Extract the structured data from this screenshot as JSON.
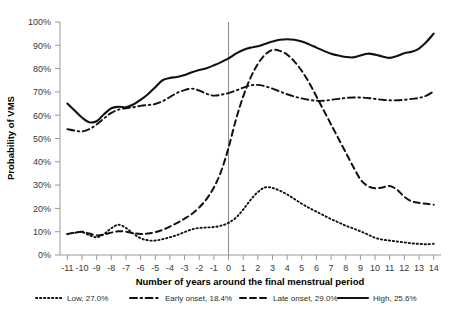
{
  "chart_data": {
    "type": "line",
    "title": "",
    "xlabel": "Number of years around the final menstrual period",
    "ylabel": "Probability of VMS",
    "xlim": [
      -11.5,
      14.5
    ],
    "ylim": [
      0,
      100
    ],
    "grid": false,
    "legend_position": "bottom",
    "y_tick_labels": [
      "0%",
      "10%",
      "20%",
      "30%",
      "40%",
      "50%",
      "60%",
      "70%",
      "80%",
      "90%",
      "100%"
    ],
    "y_tick_values": [
      0,
      10,
      20,
      30,
      40,
      50,
      60,
      70,
      80,
      90,
      100
    ],
    "x_tick_labels": [
      "-11",
      "-10",
      "-9",
      "-8",
      "-7",
      "-6",
      "-5",
      "-4",
      "-3",
      "-2",
      "-1",
      "0",
      "1",
      "2",
      "3",
      "4",
      "5",
      "6",
      "7",
      "8",
      "9",
      "10",
      "11",
      "12",
      "13",
      "14"
    ],
    "x": [
      -11,
      -10.5,
      -10,
      -9.5,
      -9,
      -8.5,
      -8,
      -7.5,
      -7,
      -6.5,
      -6,
      -5.5,
      -5,
      -4.5,
      -4,
      -3.5,
      -3,
      -2.5,
      -2,
      -1.5,
      -1,
      -0.5,
      0,
      0.5,
      1,
      1.5,
      2,
      2.5,
      3,
      3.5,
      4,
      4.5,
      5,
      5.5,
      6,
      6.5,
      7,
      7.5,
      8,
      8.5,
      9,
      9.5,
      10,
      10.5,
      11,
      11.5,
      12,
      12.5,
      13,
      13.5,
      14
    ],
    "annotations": [
      {
        "text": "vertical reference line at final menstrual period",
        "x": 0
      }
    ],
    "series": [
      {
        "name": "Low, 27.0%",
        "short_name": "Low",
        "percent": "27.0%",
        "line_style": "dotted",
        "color": "#111111",
        "values": [
          9.0,
          9.5,
          9.8,
          8.5,
          7.6,
          9.0,
          11.5,
          13.0,
          11.6,
          9.2,
          7.2,
          6.3,
          6.2,
          6.8,
          7.6,
          8.6,
          9.8,
          11.0,
          11.6,
          11.8,
          12.0,
          12.6,
          13.8,
          16.0,
          19.5,
          23.6,
          27.0,
          29.0,
          28.8,
          27.6,
          26.0,
          24.0,
          22.0,
          20.2,
          18.6,
          17.0,
          15.4,
          14.0,
          12.6,
          11.4,
          10.2,
          8.8,
          7.4,
          6.6,
          6.2,
          5.8,
          5.4,
          5.0,
          4.8,
          4.6,
          4.8
        ]
      },
      {
        "name": "Early onset, 18.4%",
        "short_name": "Early onset",
        "percent": "18.4%",
        "line_style": "dash-dot",
        "color": "#111111",
        "values": [
          54.0,
          53.4,
          53.0,
          54.0,
          56.0,
          58.6,
          61.0,
          62.4,
          63.0,
          63.4,
          64.0,
          64.4,
          64.8,
          66.0,
          67.8,
          69.6,
          70.8,
          71.4,
          70.6,
          69.2,
          68.4,
          68.8,
          69.5,
          70.6,
          71.8,
          72.8,
          73.0,
          72.4,
          71.4,
          70.2,
          69.0,
          68.0,
          67.2,
          66.6,
          66.2,
          66.2,
          66.6,
          67.0,
          67.4,
          67.6,
          67.6,
          67.4,
          67.0,
          66.6,
          66.4,
          66.4,
          66.6,
          67.0,
          67.4,
          68.4,
          70.2
        ]
      },
      {
        "name": "Late onset, 29.0%",
        "short_name": "Late onset",
        "percent": "29.0%",
        "line_style": "dashed",
        "color": "#111111",
        "values": [
          9.0,
          9.6,
          10.0,
          9.2,
          8.4,
          8.8,
          9.6,
          10.2,
          10.0,
          9.4,
          9.0,
          9.2,
          9.8,
          10.8,
          12.2,
          13.8,
          15.6,
          17.6,
          20.4,
          24.0,
          29.0,
          36.0,
          46.0,
          58.0,
          68.0,
          76.0,
          82.0,
          86.0,
          88.0,
          87.6,
          86.0,
          83.0,
          79.0,
          74.0,
          68.0,
          62.0,
          56.0,
          50.0,
          44.0,
          38.0,
          32.5,
          29.6,
          28.6,
          29.0,
          29.6,
          28.0,
          25.0,
          23.0,
          22.4,
          22.0,
          21.6
        ]
      },
      {
        "name": "High, 25.6%",
        "short_name": "High",
        "percent": "25.6%",
        "line_style": "solid",
        "color": "#111111",
        "values": [
          65.0,
          62.0,
          59.0,
          57.0,
          57.4,
          60.4,
          63.0,
          63.6,
          63.4,
          64.6,
          66.6,
          69.0,
          72.0,
          75.0,
          76.0,
          76.4,
          77.2,
          78.4,
          79.4,
          80.2,
          81.4,
          82.8,
          84.4,
          86.4,
          88.0,
          89.0,
          89.6,
          90.6,
          91.6,
          92.4,
          92.6,
          92.4,
          91.6,
          90.4,
          89.0,
          87.6,
          86.4,
          85.6,
          85.0,
          84.8,
          85.6,
          86.4,
          86.0,
          85.2,
          84.6,
          85.4,
          86.6,
          87.2,
          88.6,
          91.4,
          95.0
        ]
      }
    ]
  },
  "legend": {
    "items": [
      {
        "label": "Low, 27.0%",
        "style": "dotted"
      },
      {
        "label": "Early onset, 18.4%",
        "style": "dash-dot"
      },
      {
        "label": "Late onset, 29.0%",
        "style": "dashed"
      },
      {
        "label": "High, 25.6%",
        "style": "solid"
      }
    ]
  }
}
